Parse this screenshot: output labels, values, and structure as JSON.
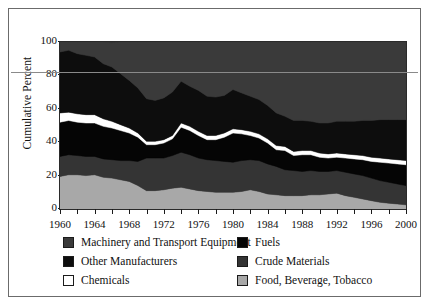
{
  "figure": {
    "border_color": "#6b6b6b"
  },
  "axes": {
    "ylabel": "Cumulative Percent",
    "yticks": [
      "100",
      "80",
      "60",
      "40",
      "20",
      "0"
    ],
    "xticks": [
      "1960",
      "1964",
      "1968",
      "1972",
      "1976",
      "1980",
      "1984",
      "1988",
      "1992",
      "1996",
      "2000"
    ]
  },
  "legend": {
    "items": [
      {
        "label": "Machinery and Transport Equipment",
        "color": "#3a3a3a",
        "col": 0,
        "row": 0
      },
      {
        "label": "Other Manufacturers",
        "color": "#0d0d0d",
        "col": 0,
        "row": 1
      },
      {
        "label": "Chemicals",
        "color": "#ffffff",
        "col": 0,
        "row": 2
      },
      {
        "label": "Fuels",
        "color": "#050505",
        "col": 1,
        "row": 0
      },
      {
        "label": "Crude Materials",
        "color": "#343434",
        "col": 1,
        "row": 1
      },
      {
        "label": "Food, Beverage, Tobacco",
        "color": "#a8a8a8",
        "col": 1,
        "row": 2
      }
    ]
  },
  "chart_data": {
    "type": "area",
    "stacked": true,
    "title": "",
    "xlabel": "",
    "ylabel": "Cumulative Percent",
    "xlim": [
      1960,
      2000
    ],
    "ylim": [
      0,
      100
    ],
    "grid": false,
    "legend_position": "bottom",
    "x": [
      1960,
      1961,
      1962,
      1963,
      1964,
      1965,
      1966,
      1967,
      1968,
      1969,
      1970,
      1971,
      1972,
      1973,
      1974,
      1975,
      1976,
      1977,
      1978,
      1979,
      1980,
      1981,
      1982,
      1983,
      1984,
      1985,
      1986,
      1987,
      1988,
      1989,
      1990,
      1991,
      1992,
      1993,
      1994,
      1995,
      1996,
      1997,
      1998,
      1999,
      2000
    ],
    "series": [
      {
        "name": "Food, Beverage, Tobacco",
        "color": "#a8a8a8",
        "values": [
          19.5,
          20.5,
          20.5,
          20.0,
          20.5,
          19.0,
          18.5,
          17.5,
          16.5,
          14.0,
          11.0,
          11.0,
          11.5,
          12.5,
          13.0,
          12.0,
          11.0,
          10.5,
          10.0,
          10.0,
          10.0,
          10.5,
          11.5,
          10.5,
          9.0,
          8.5,
          8.0,
          8.0,
          8.0,
          8.5,
          8.5,
          9.0,
          9.5,
          8.0,
          7.0,
          6.0,
          5.0,
          4.0,
          3.5,
          3.0,
          2.5
        ]
      },
      {
        "name": "Crude Materials",
        "color": "#343434",
        "values": [
          12.0,
          12.0,
          11.5,
          11.5,
          11.0,
          11.0,
          11.0,
          11.5,
          12.5,
          14.5,
          19.5,
          19.5,
          19.0,
          19.5,
          21.0,
          20.5,
          19.5,
          19.0,
          19.0,
          18.5,
          18.0,
          18.5,
          18.0,
          18.5,
          18.0,
          17.0,
          15.5,
          15.0,
          14.5,
          14.5,
          14.0,
          13.5,
          13.5,
          14.0,
          14.0,
          14.0,
          13.5,
          13.0,
          12.5,
          12.0,
          11.5
        ]
      },
      {
        "name": "Fuels",
        "color": "#050505",
        "values": [
          20.5,
          20.5,
          20.0,
          20.0,
          20.0,
          19.5,
          19.0,
          18.0,
          16.5,
          14.5,
          8.0,
          8.0,
          9.0,
          10.0,
          15.0,
          14.5,
          13.5,
          12.0,
          12.5,
          14.5,
          17.5,
          16.0,
          14.5,
          13.5,
          12.5,
          10.0,
          11.5,
          9.0,
          10.0,
          9.5,
          8.5,
          8.0,
          8.0,
          8.5,
          9.0,
          9.5,
          10.0,
          11.0,
          11.5,
          12.0,
          12.5
        ]
      },
      {
        "name": "Chemicals",
        "color": "#ffffff",
        "values": [
          5.5,
          5.0,
          5.0,
          5.0,
          5.0,
          4.5,
          4.0,
          3.5,
          3.0,
          2.5,
          2.0,
          2.0,
          2.0,
          2.0,
          2.5,
          2.5,
          2.5,
          2.5,
          2.5,
          2.5,
          2.5,
          2.5,
          2.5,
          2.5,
          2.5,
          2.5,
          2.5,
          2.5,
          2.5,
          2.5,
          2.5,
          2.5,
          2.5,
          2.5,
          2.5,
          2.5,
          2.5,
          2.5,
          2.5,
          2.5,
          2.5
        ]
      },
      {
        "name": "Other Manufacturers",
        "color": "#0d0d0d",
        "values": [
          36.5,
          37.0,
          36.0,
          35.5,
          34.5,
          33.0,
          32.5,
          30.5,
          28.5,
          27.0,
          25.5,
          24.5,
          25.0,
          26.0,
          25.0,
          24.0,
          24.5,
          23.5,
          23.0,
          22.5,
          23.5,
          22.0,
          21.0,
          20.5,
          20.0,
          19.5,
          18.0,
          18.5,
          18.0,
          17.5,
          18.0,
          18.5,
          19.0,
          19.5,
          20.0,
          21.0,
          22.0,
          23.0,
          23.5,
          24.0,
          24.5
        ]
      },
      {
        "name": "Machinery and Transport Equipment",
        "color": "#3a3a3a",
        "values": [
          6.0,
          5.0,
          7.0,
          8.0,
          9.0,
          13.0,
          14.5,
          19.0,
          23.0,
          27.5,
          34.0,
          35.0,
          33.5,
          30.0,
          23.5,
          26.5,
          29.0,
          32.5,
          33.0,
          32.0,
          28.5,
          30.5,
          32.5,
          34.5,
          38.0,
          42.5,
          44.5,
          47.0,
          47.0,
          47.5,
          48.5,
          48.5,
          47.5,
          47.5,
          47.5,
          47.0,
          47.0,
          46.5,
          46.5,
          46.5,
          46.5
        ]
      }
    ]
  }
}
